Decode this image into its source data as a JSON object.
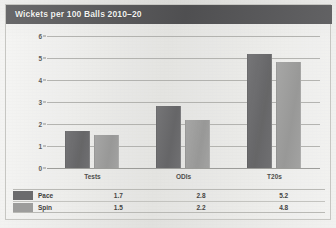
{
  "figure": {
    "title": "Wickets per 100 Balls 2010–20",
    "header_color": "#58585a",
    "header_text_color": "#f2f2f0",
    "background_color": "#e9e9e6"
  },
  "chart_data": {
    "type": "bar",
    "title": "Wickets per 100 Balls 2010–20",
    "xlabel": "",
    "ylabel": "",
    "categories": [
      "Tests",
      "ODIs",
      "T20s"
    ],
    "series": [
      {
        "name": "Pace",
        "values": [
          1.7,
          2.8,
          5.2
        ],
        "color": "#6b6b6d"
      },
      {
        "name": "Spin",
        "values": [
          1.5,
          2.2,
          4.8
        ],
        "color": "#9d9d9c"
      }
    ],
    "ylim": [
      0,
      6
    ],
    "yticks": [
      0,
      1,
      2,
      3,
      4,
      5,
      6
    ],
    "ytick_labels": [
      "0",
      "1",
      "2",
      "3",
      "4",
      "5",
      "6"
    ],
    "grid": true,
    "legend_position": "bottom-table",
    "value_labels": {
      "Pace": [
        "1.7",
        "2.8",
        "5.2"
      ],
      "Spin": [
        "1.5",
        "2.2",
        "4.8"
      ]
    }
  },
  "legend_table": {
    "rows": [
      {
        "name": "Pace",
        "swatch": "pace",
        "values": [
          "1.7",
          "2.8",
          "5.2"
        ]
      },
      {
        "name": "Spin",
        "swatch": "spin",
        "values": [
          "1.5",
          "2.2",
          "4.8"
        ]
      }
    ]
  }
}
